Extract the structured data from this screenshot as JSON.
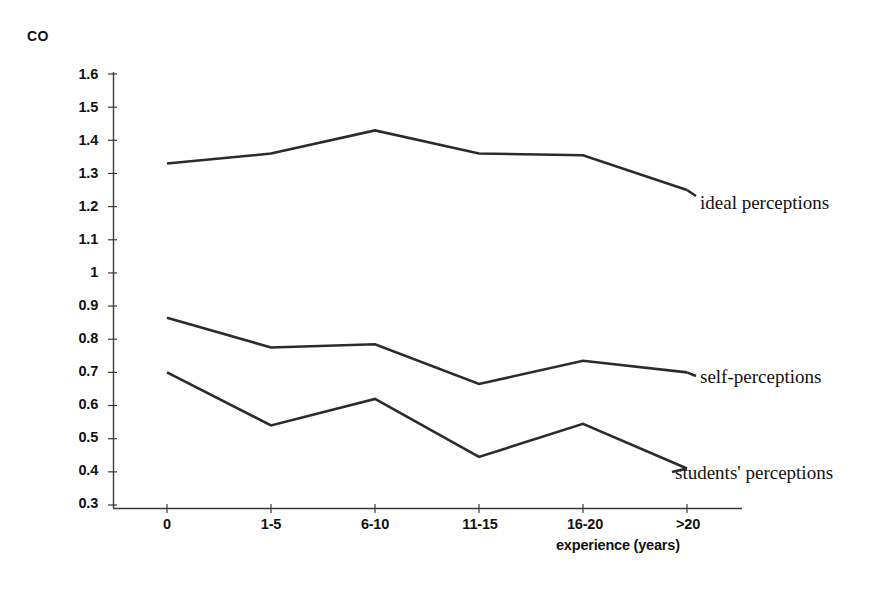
{
  "chart_data": {
    "type": "line",
    "title": "",
    "ylabel": "CO",
    "xlabel": "experience (years)",
    "categories": [
      "0",
      "1-5",
      "6-10",
      "11-15",
      "16-20",
      ">20"
    ],
    "yticks": [
      "1.6",
      "1.5",
      "1.4",
      "1.3",
      "1.2",
      "1.1",
      "1",
      "0.9",
      "0.8",
      "0.7",
      "0.6",
      "0.5",
      "0.4",
      "0.3"
    ],
    "ylim": [
      0.3,
      1.6
    ],
    "grid": false,
    "legend_position": "right-inline",
    "series": [
      {
        "name": "ideal perceptions",
        "values": [
          1.33,
          1.36,
          1.43,
          1.36,
          1.355,
          1.25
        ]
      },
      {
        "name": "self-perceptions",
        "values": [
          0.865,
          0.775,
          0.785,
          0.665,
          0.735,
          0.7
        ]
      },
      {
        "name": "students' perceptions",
        "values": [
          0.7,
          0.54,
          0.62,
          0.445,
          0.545,
          0.41
        ]
      }
    ],
    "line_color": "#2b2b2b"
  }
}
